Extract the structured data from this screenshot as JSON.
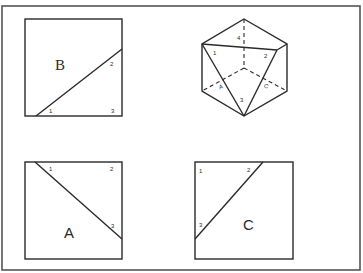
{
  "figure": {
    "type": "geometry-net-diagram",
    "panels": [
      {
        "id": "B",
        "label": "B",
        "position": "top-left",
        "corner_labels": [
          "1",
          "2",
          "3"
        ]
      },
      {
        "id": "solid",
        "label": "",
        "position": "top-right",
        "vertex_labels": [
          "4",
          "1",
          "2",
          "3"
        ],
        "face_labels": [
          "A",
          "C"
        ]
      },
      {
        "id": "A",
        "label": "A",
        "position": "bottom-left",
        "corner_labels": [
          "1",
          "2",
          "3"
        ]
      },
      {
        "id": "C",
        "label": "C",
        "position": "bottom-right",
        "corner_labels": [
          "1",
          "2",
          "3"
        ]
      }
    ]
  },
  "colors": {
    "line": "#2a2a2a",
    "frame": "#555555",
    "background": "#ffffff"
  }
}
